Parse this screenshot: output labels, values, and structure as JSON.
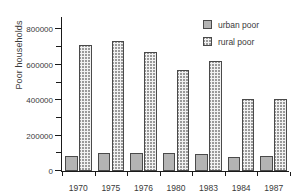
{
  "chart_data": {
    "type": "bar",
    "title": "",
    "xlabel": "",
    "ylabel": "Poor households",
    "categories": [
      "1970",
      "1975",
      "1976",
      "1980",
      "1983",
      "1984",
      "1987"
    ],
    "series": [
      {
        "name": "urban poor",
        "values": [
          85000,
          103000,
          100000,
          100000,
          98000,
          78000,
          85000
        ]
      },
      {
        "name": "rural poor",
        "values": [
          710000,
          735000,
          672000,
          570000,
          622000,
          405000,
          405000
        ]
      }
    ],
    "ylim": [
      0,
      870000
    ],
    "ytick_labels": [
      "0",
      "200000",
      "400000",
      "600000",
      "800000"
    ],
    "ytick_values": [
      0,
      200000,
      400000,
      600000,
      800000
    ],
    "yminor_step": 100000,
    "grid": false,
    "legend_position": "upper-right",
    "legend_entries": [
      "urban poor",
      "rural poor"
    ],
    "colors": {
      "urban_fill": "#b4b4b4",
      "rural_fill": "#f2f2f2",
      "rural_pattern": "#9a9a9a",
      "bar_edge": "#4a4a4a",
      "axis": "#1a1a1a",
      "text": "#3a3a3a",
      "background": "#ffffff"
    }
  }
}
